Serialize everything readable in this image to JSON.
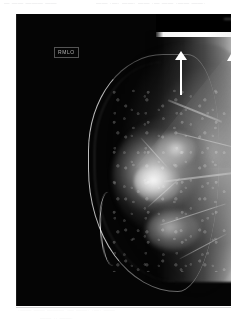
{
  "page": {
    "background_color": "#ffffff",
    "width": 249,
    "height": 324
  },
  "scan_artifacts": {
    "top_line_left": "— —— ———  ——",
    "top_line_right": "—— ·—·  ——·  —— ·— ——  ·—— ——·",
    "bottom_line_1": "·—— ——  ———  ·— ——· ·—·  ——",
    "bottom_line_2": "—— ··  ——·"
  },
  "film": {
    "modality_label": "mammogram",
    "view_marker": "RMLO",
    "border_color": "#050505",
    "left": 16,
    "top": 14,
    "width": 215,
    "height": 292
  },
  "annotations": {
    "arrow_color": "#ffffff",
    "arrows": [
      {
        "name": "arrow-marker-1",
        "direction": "up",
        "x": 158,
        "y": 37,
        "length": 44,
        "points_at": "skin-thickening-at-upper-breast-border"
      },
      {
        "name": "arrow-marker-2",
        "direction": "up",
        "x": 209,
        "y": 40,
        "length": 44,
        "points_at": "axillary-posterior-density"
      }
    ]
  },
  "anatomy": {
    "structures": [
      "skin-line",
      "fibroglandular-tissue",
      "dense-mass",
      "pectoral-muscle",
      "chest-wall-margin"
    ]
  }
}
